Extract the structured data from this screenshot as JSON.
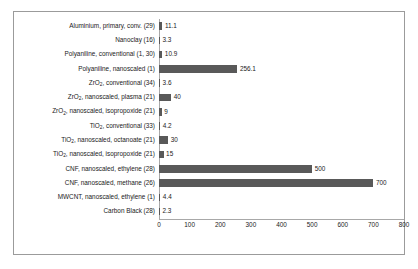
{
  "chart_data": {
    "type": "bar",
    "orientation": "horizontal",
    "title": "",
    "xlabel": "",
    "ylabel": "",
    "xlim": [
      0,
      800
    ],
    "xticks": [
      0,
      100,
      200,
      300,
      400,
      500,
      600,
      700,
      800
    ],
    "grid": false,
    "legend": false,
    "bar_color": "#595959",
    "axis_color": "#a8a8a8",
    "border_color": "#9b9b9b",
    "text_color": "#1a1a1a",
    "categories": [
      "Aluminium, primary, conv. (29)",
      "Nanoclay (16)",
      "Polyaniline, conventional (1, 30)",
      "Polyaniline, nanoscaled (1)",
      "ZrO2, conventional (34)",
      "ZrO2, nanoscaled, plasma (21)",
      "ZrO2, nanoscaled, isopropoxide (21)",
      "TiO2, conventional (33)",
      "TiO2, nanoscaled, octanoate (21)",
      "TiO2, nanoscaled, isopropoxide (21)",
      "CNF, nanoscaled, ethylene (28)",
      "CNF, nanoscaled, methane (26)",
      "MWCNT, nanoscaled, ethylene (1)",
      "Carbon Black (28)"
    ],
    "values": [
      11.1,
      3.3,
      10.9,
      256.1,
      3.6,
      40,
      9,
      4.2,
      30,
      15,
      500,
      700,
      4.4,
      2.3
    ],
    "value_labels": [
      "11.1",
      "3.3",
      "10.9",
      "256.1",
      "3.6",
      "40",
      "9",
      "4.2",
      "30",
      "15",
      "500",
      "700",
      "4.4",
      "2.3"
    ],
    "rows": [
      {
        "label_main": "Aluminium, primary, conv. (29)",
        "sub_base": "",
        "sub": "",
        "sub_rest": "",
        "value": 11.1,
        "value_label": "11.1"
      },
      {
        "label_main": "Nanoclay (16)",
        "sub_base": "",
        "sub": "",
        "sub_rest": "",
        "value": 3.3,
        "value_label": "3.3"
      },
      {
        "label_main": "Polyaniline, conventional (1, 30)",
        "sub_base": "",
        "sub": "",
        "sub_rest": "",
        "value": 10.9,
        "value_label": "10.9"
      },
      {
        "label_main": "Polyaniline, nanoscaled (1)",
        "sub_base": "",
        "sub": "",
        "sub_rest": "",
        "value": 256.1,
        "value_label": "256.1"
      },
      {
        "label_main": "",
        "sub_base": "ZrO",
        "sub": "2",
        "sub_rest": ", conventional (34)",
        "value": 3.6,
        "value_label": "3.6"
      },
      {
        "label_main": "",
        "sub_base": "ZrO",
        "sub": "2",
        "sub_rest": ", nanoscaled, plasma (21)",
        "value": 40,
        "value_label": "40"
      },
      {
        "label_main": "",
        "sub_base": "ZrO",
        "sub": "2",
        "sub_rest": ", nanoscaled, isopropoxide (21)",
        "value": 9,
        "value_label": "9"
      },
      {
        "label_main": "",
        "sub_base": "TiO",
        "sub": "2",
        "sub_rest": ", conventional (33)",
        "value": 4.2,
        "value_label": "4.2"
      },
      {
        "label_main": "",
        "sub_base": "TiO",
        "sub": "2",
        "sub_rest": ", nanoscaled, octanoate (21)",
        "value": 30,
        "value_label": "30"
      },
      {
        "label_main": "",
        "sub_base": "TiO",
        "sub": "2",
        "sub_rest": ", nanoscaled, isopropoxide (21)",
        "value": 15,
        "value_label": "15"
      },
      {
        "label_main": "CNF, nanoscaled, ethylene (28)",
        "sub_base": "",
        "sub": "",
        "sub_rest": "",
        "value": 500,
        "value_label": "500"
      },
      {
        "label_main": "CNF, nanoscaled, methane (26)",
        "sub_base": "",
        "sub": "",
        "sub_rest": "",
        "value": 700,
        "value_label": "700"
      },
      {
        "label_main": "MWCNT, nanoscaled, ethylene (1)",
        "sub_base": "",
        "sub": "",
        "sub_rest": "",
        "value": 4.4,
        "value_label": "4.4"
      },
      {
        "label_main": "Carbon Black (28)",
        "sub_base": "",
        "sub": "",
        "sub_rest": "",
        "value": 2.3,
        "value_label": "2.3"
      }
    ]
  }
}
